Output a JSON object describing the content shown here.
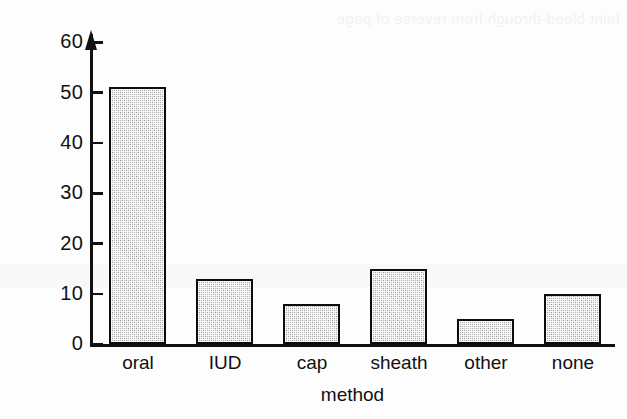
{
  "chart_data": {
    "type": "bar",
    "title": "",
    "subtitle": "",
    "categories": [
      "oral",
      "IUD",
      "cap",
      "sheath",
      "other",
      "none"
    ],
    "values": [
      51,
      13,
      8,
      15,
      5,
      10
    ],
    "series": [
      {
        "name": "% of women",
        "values": [
          51,
          13,
          8,
          15,
          5,
          10
        ]
      }
    ],
    "xlabel": "method",
    "ylabel": "%",
    "ylim": [
      0,
      60
    ],
    "yticks": [
      0,
      10,
      20,
      30,
      40,
      50,
      60
    ],
    "ytick_labels": [
      "0",
      "10",
      "20",
      "30",
      "40",
      "50",
      "60"
    ],
    "grid": false,
    "legend": false,
    "legend_position": "none",
    "bar_fill_color": "#b9b9b9",
    "bar_edge_color": "#0c0c0c",
    "axis_color": "#111111",
    "background_color": "#fdfdfd",
    "y_axis_has_arrow": true,
    "annotations": []
  },
  "axes": {
    "y_title": "%",
    "x_title": "method",
    "ticks": [
      {
        "label": "60",
        "value": 60
      },
      {
        "label": "50",
        "value": 50
      },
      {
        "label": "40",
        "value": 40
      },
      {
        "label": "30",
        "value": 30
      },
      {
        "label": "20",
        "value": 20
      },
      {
        "label": "10",
        "value": 10
      },
      {
        "label": "0",
        "value": 0
      }
    ]
  },
  "bars": [
    {
      "label": "oral",
      "value": 51
    },
    {
      "label": "IUD",
      "value": 13
    },
    {
      "label": "cap",
      "value": 8
    },
    {
      "label": "sheath",
      "value": 15
    },
    {
      "label": "other",
      "value": 5
    },
    {
      "label": "none",
      "value": 10
    }
  ],
  "scan": {
    "ghost_text": "faint bleed-through from reverse of page"
  }
}
